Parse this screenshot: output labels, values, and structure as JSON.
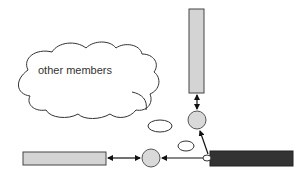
{
  "diagram": {
    "cloud_label": "other members",
    "colors": {
      "light_bar_fill": "#d4d4d4",
      "dark_bar_fill": "#333333",
      "circle_fill": "#d9d9d9",
      "stroke": "#333333",
      "background": "#ffffff"
    },
    "nodes": [
      {
        "id": "vertical-bar",
        "shape": "rect",
        "fill": "light"
      },
      {
        "id": "left-bar",
        "shape": "rect",
        "fill": "light"
      },
      {
        "id": "dark-bar",
        "shape": "rect",
        "fill": "dark"
      },
      {
        "id": "top-circle",
        "shape": "circle"
      },
      {
        "id": "left-circle",
        "shape": "circle"
      },
      {
        "id": "junction-oval",
        "shape": "ellipse"
      },
      {
        "id": "small-ellipse-1",
        "shape": "ellipse"
      },
      {
        "id": "small-ellipse-2",
        "shape": "ellipse"
      },
      {
        "id": "cloud",
        "shape": "cloud"
      }
    ],
    "edges": [
      {
        "from": "vertical-bar",
        "to": "top-circle",
        "type": "bidirectional"
      },
      {
        "from": "dark-bar",
        "to": "top-circle",
        "type": "directed"
      },
      {
        "from": "dark-bar",
        "to": "left-circle",
        "type": "directed"
      },
      {
        "from": "left-circle",
        "to": "left-bar",
        "type": "bidirectional"
      }
    ]
  }
}
